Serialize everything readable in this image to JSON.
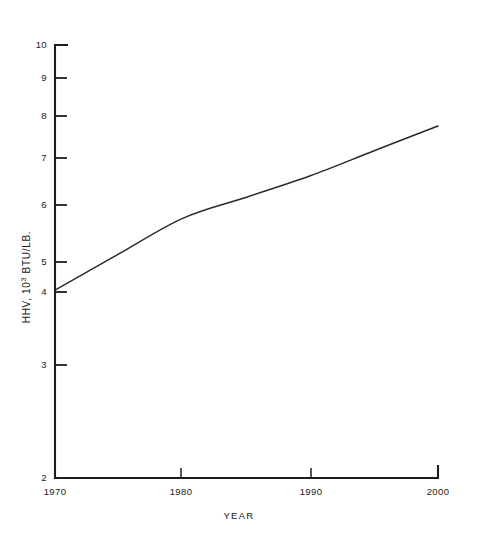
{
  "figure": {
    "background_color": "#ffffff",
    "ink_color": "#1d1d1d"
  },
  "chart_data": {
    "type": "line",
    "title": "",
    "xlabel": "YEAR",
    "ylabel": "HHV, 10³ BTU/LB.",
    "ylabel_parts": {
      "prefix": "HHV, 10",
      "exponent": "3",
      "suffix": " BTU/LB."
    },
    "yscale": "log",
    "xscale": "linear",
    "xlim": [
      1970,
      2000
    ],
    "ylim": [
      2,
      10
    ],
    "grid": false,
    "legend": null,
    "xticks": [
      1970,
      1980,
      1990,
      2000
    ],
    "xtick_labels": [
      "1970",
      "1980",
      "1990",
      "2000"
    ],
    "yticks": [
      2,
      3,
      4,
      5,
      6,
      7,
      8,
      9,
      10
    ],
    "ytick_labels": [
      "2",
      "3",
      "4",
      "5",
      "6",
      "7",
      "8",
      "9",
      "10"
    ],
    "series": [
      {
        "name": "HHV",
        "x": [
          1970,
          1975,
          1980,
          1985,
          1990,
          1995,
          2000
        ],
        "values": [
          4.02,
          4.6,
          5.25,
          5.68,
          6.15,
          6.75,
          7.4
        ]
      }
    ]
  }
}
